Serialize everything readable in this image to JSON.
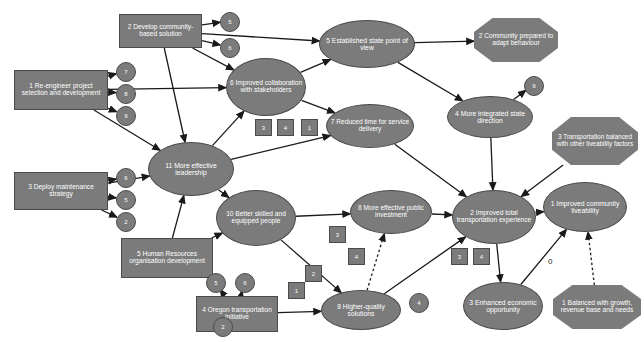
{
  "diagram": {
    "type": "node-link-diagram",
    "background_color": "#ffffff",
    "node_fill_color": "#7b7b7b",
    "node_border_color": "#4a4a4a",
    "node_text_color": "#ffffff",
    "edge_color": "#1a1a1a",
    "free_labels": [
      {
        "id": "lbl0",
        "text": "0",
        "x": 548,
        "y": 257
      }
    ],
    "nodes": [
      {
        "id": "n1",
        "shape": "rect",
        "label": "1 Re-engineer project selection and development",
        "x": 14,
        "y": 70,
        "w": 94,
        "h": 40,
        "fs": 6.6
      },
      {
        "id": "n2",
        "shape": "rect",
        "label": "2 Develop community-based solution",
        "x": 119,
        "y": 14,
        "w": 83,
        "h": 34,
        "fs": 6.6
      },
      {
        "id": "n3",
        "shape": "rect",
        "label": "3 Deploy maintenance strategy",
        "x": 14,
        "y": 172,
        "w": 94,
        "h": 38,
        "fs": 6.6
      },
      {
        "id": "n5h",
        "shape": "rect",
        "label": "5 Human Resources organisation development",
        "x": 121,
        "y": 238,
        "w": 92,
        "h": 40,
        "fs": 6.6
      },
      {
        "id": "n4o",
        "shape": "rect",
        "label": "4 Oregon transportation initiative",
        "x": 196,
        "y": 296,
        "w": 82,
        "h": 36,
        "fs": 6.6
      },
      {
        "id": "n11",
        "shape": "ellipse",
        "label": "11 More effective leadership",
        "x": 148,
        "y": 142,
        "w": 86,
        "h": 54,
        "fs": 6.8
      },
      {
        "id": "n6",
        "shape": "ellipse",
        "label": "6 Improved collaboration with stakeholders",
        "x": 226,
        "y": 58,
        "w": 80,
        "h": 58,
        "fs": 6.6
      },
      {
        "id": "n5e",
        "shape": "ellipse",
        "label": "5 Established state point of view",
        "x": 319,
        "y": 20,
        "w": 96,
        "h": 48,
        "fs": 6.8
      },
      {
        "id": "n7",
        "shape": "ellipse",
        "label": "7 Reduced time for service delivery",
        "x": 326,
        "y": 104,
        "w": 88,
        "h": 44,
        "fs": 6.6
      },
      {
        "id": "n10",
        "shape": "ellipse",
        "label": "10 Better skilled and equipped people",
        "x": 216,
        "y": 190,
        "w": 80,
        "h": 56,
        "fs": 6.6
      },
      {
        "id": "n8p",
        "shape": "ellipse",
        "label": "8 More effective public investment",
        "x": 350,
        "y": 190,
        "w": 82,
        "h": 44,
        "fs": 6.6
      },
      {
        "id": "n8h",
        "shape": "ellipse",
        "label": "8 Higher-quality solutions",
        "x": 321,
        "y": 290,
        "w": 80,
        "h": 40,
        "fs": 6.8
      },
      {
        "id": "n4i",
        "shape": "ellipse",
        "label": "4 More integrated state direction",
        "x": 447,
        "y": 96,
        "w": 86,
        "h": 42,
        "fs": 6.8
      },
      {
        "id": "n2t",
        "shape": "ellipse",
        "label": "2 Improved total transportation experience",
        "x": 452,
        "y": 190,
        "w": 84,
        "h": 54,
        "fs": 6.6
      },
      {
        "id": "n1l",
        "shape": "ellipse",
        "label": "1 Improved community liveability",
        "x": 543,
        "y": 182,
        "w": 84,
        "h": 50,
        "fs": 6.8
      },
      {
        "id": "n3e",
        "shape": "ellipse",
        "label": "3 Enhanced economic opportunity",
        "x": 463,
        "y": 282,
        "w": 80,
        "h": 48,
        "fs": 6.8
      },
      {
        "id": "n2c",
        "shape": "octagon",
        "label": "2 Community prepared to adapt behaviour",
        "x": 474,
        "y": 18,
        "w": 84,
        "h": 44,
        "fs": 6.6
      },
      {
        "id": "n3t",
        "shape": "octagon",
        "label": "3 Transportation balanced with other liveability factors",
        "x": 552,
        "y": 117,
        "w": 86,
        "h": 48,
        "fs": 6.4
      },
      {
        "id": "n1b",
        "shape": "octagon",
        "label": "1 Balanced with growth, revenue base and needs",
        "x": 553,
        "y": 285,
        "w": 88,
        "h": 44,
        "fs": 6.6
      }
    ],
    "small_circles": [
      {
        "id": "c_n2_a",
        "label": "5",
        "x": 220,
        "y": 12,
        "d": 18
      },
      {
        "id": "c_n2_b",
        "label": "6",
        "x": 220,
        "y": 38,
        "d": 18
      },
      {
        "id": "c_n1_7",
        "label": "7",
        "x": 116,
        "y": 62,
        "d": 18
      },
      {
        "id": "c_n1_8",
        "label": "8",
        "x": 116,
        "y": 84,
        "d": 18
      },
      {
        "id": "c_n1_9",
        "label": "9",
        "x": 116,
        "y": 106,
        "d": 18
      },
      {
        "id": "c_n3_6",
        "label": "6",
        "x": 116,
        "y": 168,
        "d": 18
      },
      {
        "id": "c_n3_5",
        "label": "5",
        "x": 116,
        "y": 190,
        "d": 18
      },
      {
        "id": "c_n3_2",
        "label": "2",
        "x": 116,
        "y": 212,
        "d": 18
      },
      {
        "id": "c_n4i_9",
        "label": "9",
        "x": 524,
        "y": 76,
        "d": 18
      },
      {
        "id": "c_or_5",
        "label": "5",
        "x": 206,
        "y": 273,
        "d": 18
      },
      {
        "id": "c_or_6",
        "label": "6",
        "x": 235,
        "y": 273,
        "d": 18
      },
      {
        "id": "c_hr_2",
        "label": "2",
        "x": 213,
        "y": 317,
        "d": 18
      },
      {
        "id": "c_8h_4",
        "label": "4",
        "x": 409,
        "y": 293,
        "d": 18
      }
    ],
    "small_squares": [
      {
        "id": "s_n6_3",
        "label": "3",
        "x": 255,
        "y": 119,
        "s": 15
      },
      {
        "id": "s_n6_4",
        "label": "4",
        "x": 277,
        "y": 119,
        "s": 15
      },
      {
        "id": "s_n7_1",
        "label": "1",
        "x": 301,
        "y": 119,
        "s": 15
      },
      {
        "id": "s_8p_3",
        "label": "3",
        "x": 329,
        "y": 226,
        "s": 15
      },
      {
        "id": "s_8p_4",
        "label": "4",
        "x": 348,
        "y": 248,
        "s": 15
      },
      {
        "id": "s_8h_2",
        "label": "2",
        "x": 305,
        "y": 265,
        "s": 15
      },
      {
        "id": "s_8h_1",
        "label": "1",
        "x": 288,
        "y": 282,
        "s": 15
      },
      {
        "id": "s_2t_3",
        "label": "3",
        "x": 451,
        "y": 248,
        "s": 15
      },
      {
        "id": "s_2t_4",
        "label": "4",
        "x": 473,
        "y": 248,
        "s": 15
      }
    ],
    "edges": [
      {
        "from": "n1",
        "to": "c_n1_7",
        "style": "solid"
      },
      {
        "from": "n1",
        "to": "c_n1_8",
        "style": "solid"
      },
      {
        "from": "n1",
        "to": "c_n1_9",
        "style": "solid"
      },
      {
        "from": "n1",
        "to": "n6",
        "style": "solid"
      },
      {
        "from": "n1",
        "to": "n11",
        "style": "solid"
      },
      {
        "from": "n2",
        "to": "c_n2_a",
        "style": "solid"
      },
      {
        "from": "n2",
        "to": "c_n2_b",
        "style": "solid"
      },
      {
        "from": "n2",
        "to": "n6",
        "style": "solid"
      },
      {
        "from": "n2",
        "to": "n11",
        "style": "solid"
      },
      {
        "from": "n2",
        "to": "n5e",
        "style": "solid"
      },
      {
        "from": "n3",
        "to": "c_n3_6",
        "style": "solid"
      },
      {
        "from": "n3",
        "to": "c_n3_5",
        "style": "solid"
      },
      {
        "from": "n3",
        "to": "c_n3_2",
        "style": "solid"
      },
      {
        "from": "n3",
        "to": "n11",
        "style": "solid"
      },
      {
        "from": "n5h",
        "to": "n11",
        "style": "solid"
      },
      {
        "from": "n5h",
        "to": "n10",
        "style": "solid"
      },
      {
        "from": "n4o",
        "to": "c_or_5",
        "style": "solid"
      },
      {
        "from": "n4o",
        "to": "c_or_6",
        "style": "solid"
      },
      {
        "from": "n4o",
        "to": "n8h",
        "style": "solid"
      },
      {
        "from": "n11",
        "to": "n6",
        "style": "solid"
      },
      {
        "from": "n11",
        "to": "n10",
        "style": "solid"
      },
      {
        "from": "n11",
        "to": "n7",
        "style": "solid"
      },
      {
        "from": "n6",
        "to": "n5e",
        "style": "solid"
      },
      {
        "from": "n6",
        "to": "n7",
        "style": "solid"
      },
      {
        "from": "n5e",
        "to": "n2c",
        "style": "solid"
      },
      {
        "from": "n5e",
        "to": "n4i",
        "style": "solid"
      },
      {
        "from": "n7",
        "to": "n2t",
        "style": "solid"
      },
      {
        "from": "n10",
        "to": "n8p",
        "style": "solid"
      },
      {
        "from": "n10",
        "to": "n8h",
        "style": "solid"
      },
      {
        "from": "n8p",
        "to": "n2t",
        "style": "solid"
      },
      {
        "from": "n8h",
        "to": "n8p",
        "style": "dashed"
      },
      {
        "from": "n8h",
        "to": "n2t",
        "style": "solid"
      },
      {
        "from": "n4i",
        "to": "c_n4i_9",
        "style": "solid"
      },
      {
        "from": "n4i",
        "to": "n2t",
        "style": "solid"
      },
      {
        "from": "n3t",
        "to": "n2t",
        "style": "solid"
      },
      {
        "from": "n2t",
        "to": "n1l",
        "style": "solid"
      },
      {
        "from": "n2t",
        "to": "n3e",
        "style": "solid"
      },
      {
        "from": "n3e",
        "to": "n1l",
        "style": "solid"
      },
      {
        "from": "n1b",
        "to": "n1l",
        "style": "dashed"
      }
    ]
  }
}
